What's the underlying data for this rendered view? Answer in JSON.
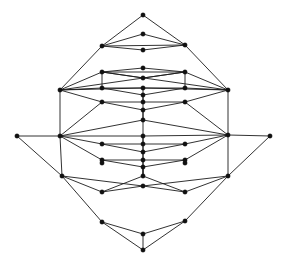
{
  "figure": {
    "background_color": "#ffffff",
    "node_color": "#111111",
    "edge_color": "#1b1b1b",
    "node_radius": 2.2,
    "edge_width": 0.9,
    "canvas": {
      "width": 284,
      "height": 267
    }
  },
  "chart_data": {
    "type": "diagram",
    "title": "",
    "xlabel": "",
    "ylabel": "",
    "node_count": 47,
    "edge_count": 96,
    "nodes": [
      {
        "id": 0,
        "label": "top",
        "x": 143,
        "y": 15
      },
      {
        "id": 1,
        "label": "n1",
        "x": 143,
        "y": 34
      },
      {
        "id": 2,
        "label": "n2",
        "x": 102,
        "y": 46
      },
      {
        "id": 3,
        "label": "n3",
        "x": 185,
        "y": 45
      },
      {
        "id": 4,
        "label": "n4",
        "x": 143,
        "y": 50
      },
      {
        "id": 5,
        "label": "n5",
        "x": 143,
        "y": 68
      },
      {
        "id": 6,
        "label": "n6",
        "x": 102,
        "y": 72
      },
      {
        "id": 7,
        "label": "n7",
        "x": 185,
        "y": 72
      },
      {
        "id": 8,
        "label": "n8",
        "x": 143,
        "y": 78
      },
      {
        "id": 9,
        "label": "n9",
        "x": 60,
        "y": 90
      },
      {
        "id": 10,
        "label": "n10",
        "x": 228,
        "y": 90
      },
      {
        "id": 11,
        "label": "n11",
        "x": 102,
        "y": 88
      },
      {
        "id": 12,
        "label": "n12",
        "x": 143,
        "y": 88
      },
      {
        "id": 13,
        "label": "n13",
        "x": 185,
        "y": 88
      },
      {
        "id": 14,
        "label": "n14",
        "x": 143,
        "y": 95
      },
      {
        "id": 15,
        "label": "n15",
        "x": 102,
        "y": 102
      },
      {
        "id": 16,
        "label": "n16",
        "x": 143,
        "y": 102
      },
      {
        "id": 17,
        "label": "n17",
        "x": 185,
        "y": 102
      },
      {
        "id": 18,
        "label": "n18",
        "x": 143,
        "y": 110
      },
      {
        "id": 19,
        "label": "n19",
        "x": 143,
        "y": 120
      },
      {
        "id": 20,
        "label": "left",
        "x": 17,
        "y": 136
      },
      {
        "id": 21,
        "label": "right",
        "x": 270,
        "y": 136
      },
      {
        "id": 22,
        "label": "n22",
        "x": 60,
        "y": 136
      },
      {
        "id": 23,
        "label": "n23",
        "x": 228,
        "y": 135
      },
      {
        "id": 24,
        "label": "n24",
        "x": 143,
        "y": 136
      },
      {
        "id": 25,
        "label": "n25",
        "x": 102,
        "y": 144
      },
      {
        "id": 26,
        "label": "n26",
        "x": 143,
        "y": 144
      },
      {
        "id": 27,
        "label": "n27",
        "x": 185,
        "y": 144
      },
      {
        "id": 28,
        "label": "n28",
        "x": 143,
        "y": 152
      },
      {
        "id": 29,
        "label": "n29",
        "x": 102,
        "y": 160
      },
      {
        "id": 30,
        "label": "n30",
        "x": 143,
        "y": 160
      },
      {
        "id": 31,
        "label": "n31",
        "x": 185,
        "y": 160
      },
      {
        "id": 32,
        "label": "n32",
        "x": 143,
        "y": 167
      },
      {
        "id": 33,
        "label": "n33",
        "x": 102,
        "y": 163
      },
      {
        "id": 34,
        "label": "n34",
        "x": 185,
        "y": 163
      },
      {
        "id": 35,
        "label": "n35",
        "x": 143,
        "y": 176
      },
      {
        "id": 36,
        "label": "n36",
        "x": 62,
        "y": 176
      },
      {
        "id": 37,
        "label": "n37",
        "x": 228,
        "y": 176
      },
      {
        "id": 38,
        "label": "n38",
        "x": 143,
        "y": 186
      },
      {
        "id": 39,
        "label": "n39",
        "x": 102,
        "y": 192
      },
      {
        "id": 40,
        "label": "n40",
        "x": 185,
        "y": 192
      },
      {
        "id": 41,
        "label": "n41",
        "x": 102,
        "y": 222
      },
      {
        "id": 42,
        "label": "n42",
        "x": 185,
        "y": 221
      },
      {
        "id": 43,
        "label": "n43",
        "x": 143,
        "y": 234
      },
      {
        "id": 44,
        "label": "bottom",
        "x": 143,
        "y": 250
      }
    ],
    "edges": [
      [
        0,
        2
      ],
      [
        0,
        3
      ],
      [
        1,
        2
      ],
      [
        1,
        3
      ],
      [
        2,
        4
      ],
      [
        3,
        4
      ],
      [
        2,
        3
      ],
      [
        2,
        9
      ],
      [
        3,
        10
      ],
      [
        5,
        6
      ],
      [
        5,
        7
      ],
      [
        6,
        8
      ],
      [
        7,
        8
      ],
      [
        6,
        7
      ],
      [
        6,
        11
      ],
      [
        7,
        13
      ],
      [
        9,
        6
      ],
      [
        9,
        7
      ],
      [
        10,
        6
      ],
      [
        10,
        7
      ],
      [
        9,
        11
      ],
      [
        9,
        12
      ],
      [
        9,
        15
      ],
      [
        10,
        13
      ],
      [
        10,
        12
      ],
      [
        10,
        17
      ],
      [
        11,
        12
      ],
      [
        12,
        13
      ],
      [
        11,
        14
      ],
      [
        13,
        14
      ],
      [
        12,
        16
      ],
      [
        14,
        16
      ],
      [
        15,
        16
      ],
      [
        16,
        17
      ],
      [
        15,
        18
      ],
      [
        17,
        18
      ],
      [
        16,
        19
      ],
      [
        18,
        19
      ],
      [
        15,
        22
      ],
      [
        17,
        23
      ],
      [
        9,
        22
      ],
      [
        10,
        23
      ],
      [
        20,
        22
      ],
      [
        21,
        23
      ],
      [
        22,
        19
      ],
      [
        23,
        19
      ],
      [
        22,
        24
      ],
      [
        23,
        24
      ],
      [
        22,
        25
      ],
      [
        23,
        27
      ],
      [
        22,
        29
      ],
      [
        23,
        31
      ],
      [
        24,
        26
      ],
      [
        26,
        25
      ],
      [
        26,
        27
      ],
      [
        25,
        28
      ],
      [
        27,
        28
      ],
      [
        26,
        28
      ],
      [
        28,
        30
      ],
      [
        29,
        30
      ],
      [
        30,
        31
      ],
      [
        29,
        32
      ],
      [
        31,
        32
      ],
      [
        30,
        35
      ],
      [
        32,
        35
      ],
      [
        22,
        36
      ],
      [
        23,
        37
      ],
      [
        20,
        36
      ],
      [
        21,
        37
      ],
      [
        36,
        39
      ],
      [
        37,
        40
      ],
      [
        36,
        41
      ],
      [
        37,
        42
      ],
      [
        39,
        38
      ],
      [
        40,
        38
      ],
      [
        36,
        38
      ],
      [
        37,
        38
      ],
      [
        41,
        43
      ],
      [
        42,
        43
      ],
      [
        41,
        44
      ],
      [
        42,
        44
      ],
      [
        43,
        44
      ],
      [
        35,
        39
      ],
      [
        35,
        40
      ],
      [
        33,
        29
      ],
      [
        34,
        31
      ],
      [
        19,
        24
      ],
      [
        24,
        35
      ]
    ]
  }
}
